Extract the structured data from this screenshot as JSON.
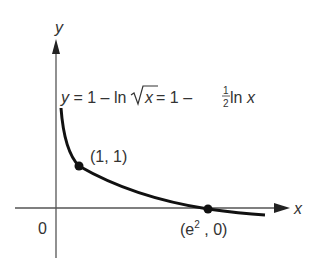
{
  "diagram": {
    "axes": {
      "x_label": "x",
      "y_label": "y",
      "origin_label": "0"
    },
    "equation": {
      "lhs": "y",
      "eq1": " = 1 – ln",
      "sqrt_arg": "x",
      "eq2": " = 1 – ",
      "frac_num": "1",
      "frac_den": "2",
      "eq3": " ln ",
      "var": "x"
    },
    "points": [
      {
        "label": "(1, 1)"
      },
      {
        "label_base": "(e",
        "label_sup": "2",
        "label_tail": " , 0)"
      }
    ],
    "colors": {
      "curve": "#111111",
      "axes": "#555555",
      "text": "#333333"
    }
  }
}
